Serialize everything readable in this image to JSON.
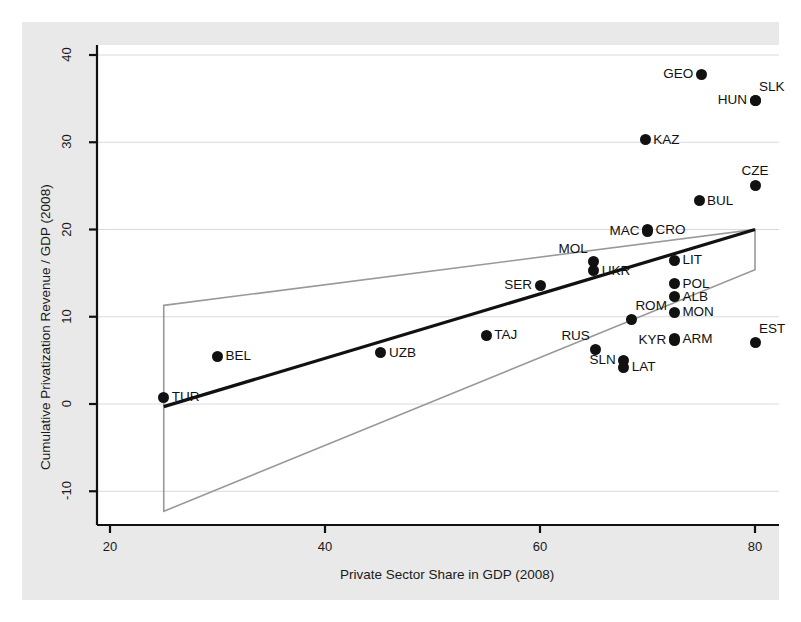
{
  "chart_data": {
    "type": "scatter",
    "title": "",
    "xlabel": "Private Sector Share in GDP (2008)",
    "ylabel": "Cumulative Privatization Revenue / GDP (2008)",
    "xlim": [
      20,
      82
    ],
    "ylim": [
      -13,
      42
    ],
    "xticks": [
      20,
      40,
      60,
      80
    ],
    "yticks": [
      -10,
      0,
      10,
      20,
      30,
      40
    ],
    "xtick_labels": [
      "20",
      "40",
      "60",
      "80"
    ],
    "ytick_labels": [
      "-10",
      "0",
      "10",
      "20",
      "30",
      "40"
    ],
    "grid": true,
    "grid_axis": "y",
    "legend": "none",
    "points": [
      {
        "label": "TUR",
        "x": 25.0,
        "y": 0.8,
        "label_pos": "right"
      },
      {
        "label": "BEL",
        "x": 30.0,
        "y": 5.5,
        "label_pos": "right"
      },
      {
        "label": "UZB",
        "x": 45.2,
        "y": 5.9,
        "label_pos": "right"
      },
      {
        "label": "TAJ",
        "x": 55.0,
        "y": 7.9,
        "label_pos": "right"
      },
      {
        "label": "SER",
        "x": 60.0,
        "y": 13.6,
        "label_pos": "left"
      },
      {
        "label": "MOL",
        "x": 65.0,
        "y": 16.3,
        "label_pos": "above-left"
      },
      {
        "label": "UKR",
        "x": 65.0,
        "y": 15.3,
        "label_pos": "right"
      },
      {
        "label": "RUS",
        "x": 65.2,
        "y": 6.3,
        "label_pos": "above-left"
      },
      {
        "label": "SLN",
        "x": 67.8,
        "y": 5.0,
        "label_pos": "left"
      },
      {
        "label": "LAT",
        "x": 67.8,
        "y": 4.2,
        "label_pos": "right"
      },
      {
        "label": "ROM",
        "x": 68.5,
        "y": 9.7,
        "label_pos": "above-right"
      },
      {
        "label": "MAC",
        "x": 70.0,
        "y": 19.8,
        "label_pos": "left"
      },
      {
        "label": "CRO",
        "x": 70.0,
        "y": 20.0,
        "label_pos": "right"
      },
      {
        "label": "KAZ",
        "x": 69.8,
        "y": 30.3,
        "label_pos": "right"
      },
      {
        "label": "GEO",
        "x": 75.0,
        "y": 37.8,
        "label_pos": "left"
      },
      {
        "label": "KYR",
        "x": 72.5,
        "y": 7.3,
        "label_pos": "left"
      },
      {
        "label": "ARM",
        "x": 72.5,
        "y": 7.5,
        "label_pos": "right"
      },
      {
        "label": "MON",
        "x": 72.5,
        "y": 10.5,
        "label_pos": "right"
      },
      {
        "label": "ALB",
        "x": 72.5,
        "y": 12.3,
        "label_pos": "right"
      },
      {
        "label": "POL",
        "x": 72.5,
        "y": 13.8,
        "label_pos": "right"
      },
      {
        "label": "LIT",
        "x": 72.5,
        "y": 16.5,
        "label_pos": "right"
      },
      {
        "label": "BUL",
        "x": 74.8,
        "y": 23.3,
        "label_pos": "right"
      },
      {
        "label": "HUN",
        "x": 80.0,
        "y": 34.8,
        "label_pos": "left"
      },
      {
        "label": "SLK",
        "x": 80.0,
        "y": 34.8,
        "label_pos": "above-right"
      },
      {
        "label": "EST",
        "x": 80.0,
        "y": 7.1,
        "label_pos": "above-right"
      },
      {
        "label": "CZE",
        "x": 80.0,
        "y": 25.0,
        "label_pos": "above"
      }
    ],
    "fit_line": {
      "name": "regression-line",
      "color": "#111111",
      "x1": 25.0,
      "y1": -0.3,
      "x2": 80.0,
      "y2": 20.0
    },
    "confidence_band": {
      "name": "confidence-interval",
      "color": "#999999",
      "upper": {
        "x1": 25.0,
        "y1": 11.3,
        "x2": 80.0,
        "y2": 20.0
      },
      "lower": {
        "x1": 25.0,
        "y1": -12.3,
        "x2": 80.0,
        "y2": 15.4
      },
      "left_edge_x": 25.0,
      "right_edge_x": 80.0
    }
  }
}
